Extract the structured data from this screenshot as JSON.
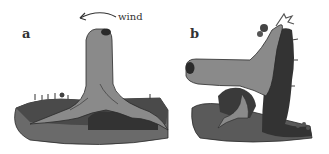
{
  "figure": {
    "panels": [
      {
        "label": "a",
        "description": "Upright tree stump with spreading roots on ground"
      },
      {
        "label": "b",
        "description": "Stump bent sideways with root mass and mosses/vegetation"
      }
    ],
    "annotation": {
      "text": "wind",
      "arrow_direction": "left"
    }
  },
  "colors": {
    "stump": "#8a8a8a",
    "dark_soil": "#3a3a3a",
    "ground": "#6e6e6e",
    "outline": "#2a2a2a"
  }
}
